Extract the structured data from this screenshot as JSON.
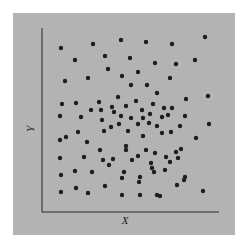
{
  "chart_data": {
    "type": "scatter",
    "title": "",
    "xlabel": "X",
    "ylabel": "Y",
    "grid": false,
    "legend": null,
    "ticks": false,
    "colors": {
      "background": "#b3b3b3",
      "point": "#1e1e1e",
      "axis": "#262626",
      "page": "#ffffff"
    },
    "points_px": [
      [
        61,
        48
      ],
      [
        93,
        44
      ],
      [
        121,
        40
      ],
      [
        146,
        42
      ],
      [
        172,
        44
      ],
      [
        205,
        37
      ],
      [
        75,
        60
      ],
      [
        105,
        56
      ],
      [
        130,
        58
      ],
      [
        155,
        63
      ],
      [
        176,
        64
      ],
      [
        195,
        60
      ],
      [
        65,
        81
      ],
      [
        88,
        78
      ],
      [
        108,
        69
      ],
      [
        138,
        72
      ],
      [
        122,
        76
      ],
      [
        170,
        78
      ],
      [
        62,
        104
      ],
      [
        76,
        103
      ],
      [
        99,
        102
      ],
      [
        118,
        97
      ],
      [
        131,
        85
      ],
      [
        147,
        85
      ],
      [
        157,
        93
      ],
      [
        186,
        99
      ],
      [
        172,
        108
      ],
      [
        208,
        96
      ],
      [
        91,
        110
      ],
      [
        101,
        110
      ],
      [
        112,
        107
      ],
      [
        126,
        106
      ],
      [
        136,
        101
      ],
      [
        142,
        110
      ],
      [
        153,
        104
      ],
      [
        164,
        108
      ],
      [
        185,
        116
      ],
      [
        60,
        116
      ],
      [
        81,
        117
      ],
      [
        114,
        112
      ],
      [
        121,
        116
      ],
      [
        131,
        118
      ],
      [
        143,
        118
      ],
      [
        150,
        114
      ],
      [
        162,
        117
      ],
      [
        168,
        115
      ],
      [
        66,
        137
      ],
      [
        78,
        132
      ],
      [
        102,
        120
      ],
      [
        111,
        127
      ],
      [
        119,
        124
      ],
      [
        138,
        124
      ],
      [
        149,
        123
      ],
      [
        157,
        126
      ],
      [
        180,
        126
      ],
      [
        60,
        140
      ],
      [
        87,
        142
      ],
      [
        104,
        131
      ],
      [
        128,
        131
      ],
      [
        143,
        136
      ],
      [
        162,
        133
      ],
      [
        171,
        132
      ],
      [
        209,
        124
      ],
      [
        100,
        150
      ],
      [
        126,
        146
      ],
      [
        146,
        150
      ],
      [
        155,
        153
      ],
      [
        181,
        149
      ],
      [
        196,
        138
      ],
      [
        176,
        152
      ],
      [
        170,
        162
      ],
      [
        60,
        158
      ],
      [
        84,
        157
      ],
      [
        103,
        160
      ],
      [
        113,
        159
      ],
      [
        126,
        150
      ],
      [
        132,
        160
      ],
      [
        138,
        156
      ],
      [
        151,
        163
      ],
      [
        166,
        157
      ],
      [
        178,
        158
      ],
      [
        61,
        175
      ],
      [
        75,
        171
      ],
      [
        92,
        172
      ],
      [
        109,
        165
      ],
      [
        124,
        172
      ],
      [
        140,
        177
      ],
      [
        152,
        168
      ],
      [
        165,
        170
      ],
      [
        185,
        177
      ],
      [
        61,
        192
      ],
      [
        88,
        193
      ],
      [
        105,
        186
      ],
      [
        122,
        178
      ],
      [
        139,
        182
      ],
      [
        154,
        172
      ],
      [
        177,
        185
      ],
      [
        203,
        191
      ],
      [
        76,
        188
      ],
      [
        122,
        195
      ],
      [
        140,
        195
      ],
      [
        157,
        195
      ],
      [
        184,
        180
      ],
      [
        160,
        196
      ]
    ]
  },
  "axes": {
    "x_label": "X",
    "y_label": "Y"
  }
}
